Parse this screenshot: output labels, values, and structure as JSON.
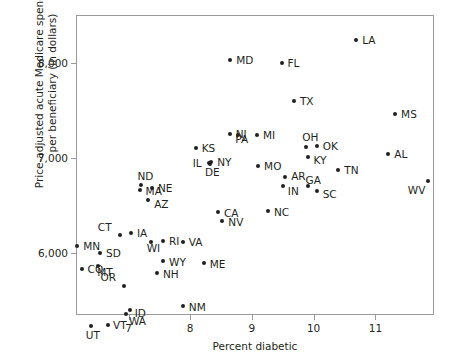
{
  "chart_data": {
    "type": "scatter",
    "title": "",
    "xlabel": "Percent diabetic",
    "ylabel": "Price-adjusted acute Medicare spending per beneficiary (in dollars)",
    "ylabel_line1": "Price-adjusted acute Medicare spending",
    "ylabel_line2": "per beneficiary (in dollars)",
    "xlim": [
      6.15,
      11.95
    ],
    "ylim": [
      5350,
      8500
    ],
    "xticks": [
      7,
      8,
      9,
      10,
      11
    ],
    "xticklabels": [
      "7",
      "8",
      "9",
      "10",
      "11"
    ],
    "yticks": [
      6000,
      7000,
      8000
    ],
    "yticklabels": [
      "6,000",
      "7,000",
      "8,000"
    ],
    "grid": false,
    "legend": null,
    "point_color": "#231f20",
    "frame_color": "#9a9a9a",
    "points": [
      {
        "label": "MN",
        "x": 6.17,
        "y": 6070,
        "lx": 6,
        "ly": -5
      },
      {
        "label": "CO",
        "x": 6.24,
        "y": 5830,
        "lx": 6,
        "ly": -5
      },
      {
        "label": "UT",
        "x": 6.39,
        "y": 5235,
        "lx": -5,
        "ly": 4
      },
      {
        "label": "SD",
        "x": 6.54,
        "y": 6000,
        "lx": 6,
        "ly": -5
      },
      {
        "label": "MT",
        "x": 6.51,
        "y": 5860,
        "lx": -1,
        "ly": 1
      },
      {
        "label": "VT",
        "x": 6.67,
        "y": 5250,
        "lx": 5,
        "ly": -5
      },
      {
        "label": "CT",
        "x": 6.86,
        "y": 6190,
        "lx": -22,
        "ly": -13
      },
      {
        "label": "WA",
        "x": 6.96,
        "y": 5360,
        "lx": 3,
        "ly": 2
      },
      {
        "label": "OR",
        "x": 6.92,
        "y": 5650,
        "lx": -23,
        "ly": -14
      },
      {
        "label": "ID",
        "x": 7.02,
        "y": 5400,
        "lx": 5,
        "ly": -2
      },
      {
        "label": "IA",
        "x": 7.04,
        "y": 6215,
        "lx": 6,
        "ly": -5
      },
      {
        "label": "MA",
        "x": 7.18,
        "y": 6660,
        "lx": 6,
        "ly": -4
      },
      {
        "label": "ND",
        "x": 7.21,
        "y": 6720,
        "lx": -4,
        "ly": -14
      },
      {
        "label": "NE",
        "x": 7.38,
        "y": 6680,
        "lx": 6,
        "ly": -5
      },
      {
        "label": "WI",
        "x": 7.36,
        "y": 6120,
        "lx": -4,
        "ly": 1
      },
      {
        "label": "AZ",
        "x": 7.32,
        "y": 6560,
        "lx": 6,
        "ly": -1
      },
      {
        "label": "RI",
        "x": 7.56,
        "y": 6130,
        "lx": 6,
        "ly": -5
      },
      {
        "label": "NH",
        "x": 7.46,
        "y": 5790,
        "lx": 6,
        "ly": -4
      },
      {
        "label": "WY",
        "x": 7.56,
        "y": 5920,
        "lx": 6,
        "ly": -4
      },
      {
        "label": "KS",
        "x": 8.09,
        "y": 7100,
        "lx": 6,
        "ly": -5
      },
      {
        "label": "VA",
        "x": 7.88,
        "y": 6120,
        "lx": 6,
        "ly": -5
      },
      {
        "label": "ME",
        "x": 8.22,
        "y": 5900,
        "lx": 6,
        "ly": -4
      },
      {
        "label": "NM",
        "x": 7.88,
        "y": 5440,
        "lx": 6,
        "ly": -4
      },
      {
        "label": "IL",
        "x": 8.3,
        "y": 6950,
        "lx": -16,
        "ly": -5
      },
      {
        "label": "DE",
        "x": 8.32,
        "y": 6940,
        "lx": -5,
        "ly": 3
      },
      {
        "label": "NY",
        "x": 8.34,
        "y": 6960,
        "lx": 6,
        "ly": -5
      },
      {
        "label": "NJ",
        "x": 8.64,
        "y": 7250,
        "lx": 6,
        "ly": -5
      },
      {
        "label": "MD",
        "x": 8.65,
        "y": 8030,
        "lx": 6,
        "ly": -5
      },
      {
        "label": "CA",
        "x": 8.45,
        "y": 6430,
        "lx": 6,
        "ly": -4
      },
      {
        "label": "NV",
        "x": 8.52,
        "y": 6340,
        "lx": 6,
        "ly": -4
      },
      {
        "label": "PA",
        "x": 8.78,
        "y": 7245,
        "lx": -3,
        "ly": -1
      },
      {
        "label": "MI",
        "x": 9.08,
        "y": 7245,
        "lx": 6,
        "ly": -5
      },
      {
        "label": "MO",
        "x": 9.1,
        "y": 6910,
        "lx": 6,
        "ly": -5
      },
      {
        "label": "NC",
        "x": 9.26,
        "y": 6440,
        "lx": 6,
        "ly": -4
      },
      {
        "label": "FL",
        "x": 9.48,
        "y": 8000,
        "lx": 6,
        "ly": -5
      },
      {
        "label": "AR",
        "x": 9.54,
        "y": 6800,
        "lx": 6,
        "ly": -6
      },
      {
        "label": "IN",
        "x": 9.5,
        "y": 6700,
        "lx": 5,
        "ly": 0
      },
      {
        "label": "TX",
        "x": 9.68,
        "y": 7600,
        "lx": 6,
        "ly": -5
      },
      {
        "label": "OH",
        "x": 9.88,
        "y": 7110,
        "lx": -4,
        "ly": -15
      },
      {
        "label": "KY",
        "x": 9.9,
        "y": 7010,
        "lx": 6,
        "ly": -2
      },
      {
        "label": "GA",
        "x": 9.9,
        "y": 6710,
        "lx": -2,
        "ly": -11
      },
      {
        "label": "OK",
        "x": 10.05,
        "y": 7125,
        "lx": 6,
        "ly": -5
      },
      {
        "label": "SC",
        "x": 10.05,
        "y": 6650,
        "lx": 6,
        "ly": -2
      },
      {
        "label": "TN",
        "x": 10.4,
        "y": 6870,
        "lx": 6,
        "ly": -5
      },
      {
        "label": "LA",
        "x": 10.69,
        "y": 8240,
        "lx": 6,
        "ly": -5
      },
      {
        "label": "AL",
        "x": 11.21,
        "y": 7040,
        "lx": 6,
        "ly": -5
      },
      {
        "label": "MS",
        "x": 11.32,
        "y": 7460,
        "lx": 6,
        "ly": -5
      },
      {
        "label": "WV",
        "x": 11.85,
        "y": 6760,
        "lx": -20,
        "ly": 4
      }
    ]
  }
}
